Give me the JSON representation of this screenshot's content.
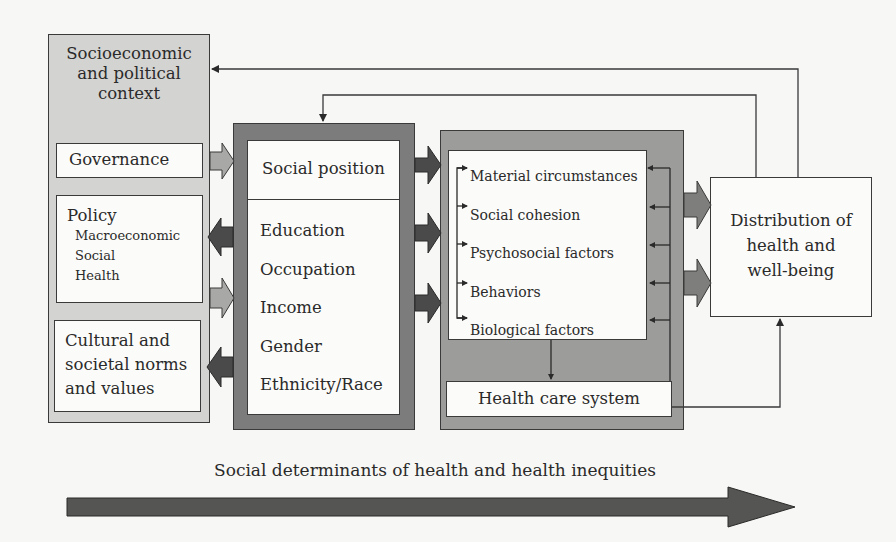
{
  "diagram": {
    "title_footer": "Social determinants of health and health inequities",
    "context_panel": {
      "title": "Socioeconomic and political context",
      "title_lines": [
        "Socioeconomic",
        "and political",
        "context"
      ],
      "governance": "Governance",
      "policy": {
        "label": "Policy",
        "items": [
          "Macroeconomic",
          "Social",
          "Health"
        ]
      },
      "cultural_lines": [
        "Cultural and",
        "societal norms",
        "and values"
      ]
    },
    "social_position_panel": {
      "title": "Social position",
      "items": [
        "Education",
        "Occupation",
        "Income",
        "Gender",
        "Ethnicity/Race"
      ]
    },
    "intermediary_panel": {
      "items": [
        "Material circumstances",
        "Social cohesion",
        "Psychosocial factors",
        "Behaviors",
        "Biological factors"
      ],
      "health_care_system": "Health care system"
    },
    "outcome": {
      "lines": [
        "Distribution of",
        "health and",
        "well-being"
      ]
    },
    "colors": {
      "light_panel": "#d3d3d1",
      "dark_panel": "#7c7c7c",
      "mid_panel": "#9c9c9a",
      "dark_arrow": "#4a4a4a",
      "light_arrow": "#a8a8a6",
      "mid_arrow": "#7e7e7c",
      "line": "#3a3a3a"
    }
  }
}
